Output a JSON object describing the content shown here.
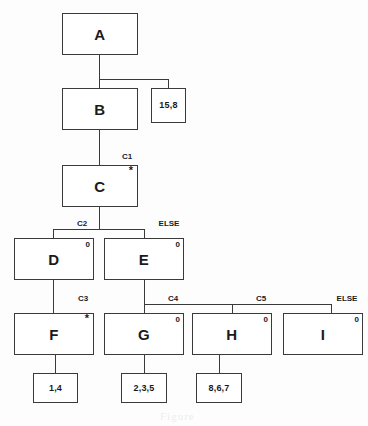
{
  "diagram": {
    "type": "jackson-structure-chart",
    "nodes": [
      {
        "id": "A",
        "label": "A",
        "marker": "",
        "condition": ""
      },
      {
        "id": "B",
        "label": "B",
        "marker": "",
        "condition": ""
      },
      {
        "id": "N1",
        "label": "15,8",
        "marker": "",
        "condition": ""
      },
      {
        "id": "C",
        "label": "C",
        "marker": "*",
        "condition": "C1"
      },
      {
        "id": "D",
        "label": "D",
        "marker": "0",
        "condition": "C2"
      },
      {
        "id": "E",
        "label": "E",
        "marker": "0",
        "condition": "ELSE"
      },
      {
        "id": "F",
        "label": "F",
        "marker": "*",
        "condition": "C3"
      },
      {
        "id": "G",
        "label": "G",
        "marker": "0",
        "condition": "C4"
      },
      {
        "id": "H",
        "label": "H",
        "marker": "0",
        "condition": "C5"
      },
      {
        "id": "I",
        "label": "I",
        "marker": "0",
        "condition": "ELSE"
      },
      {
        "id": "N2",
        "label": "1,4",
        "marker": "",
        "condition": ""
      },
      {
        "id": "N3",
        "label": "2,3,5",
        "marker": "",
        "condition": ""
      },
      {
        "id": "N4",
        "label": "8,6,7",
        "marker": "",
        "condition": ""
      }
    ],
    "edges": [
      {
        "from": "A",
        "to": "B"
      },
      {
        "from": "A",
        "to": "N1"
      },
      {
        "from": "B",
        "to": "C"
      },
      {
        "from": "C",
        "to": "D"
      },
      {
        "from": "C",
        "to": "E"
      },
      {
        "from": "D",
        "to": "F"
      },
      {
        "from": "E",
        "to": "G"
      },
      {
        "from": "E",
        "to": "H"
      },
      {
        "from": "E",
        "to": "I"
      },
      {
        "from": "F",
        "to": "N2"
      },
      {
        "from": "G",
        "to": "N3"
      },
      {
        "from": "H",
        "to": "N4"
      }
    ],
    "colors": {
      "stroke": "#3a3a3a",
      "text": "#1a1a1a",
      "background": "#fdfdfd"
    },
    "smudge": "Figure"
  }
}
